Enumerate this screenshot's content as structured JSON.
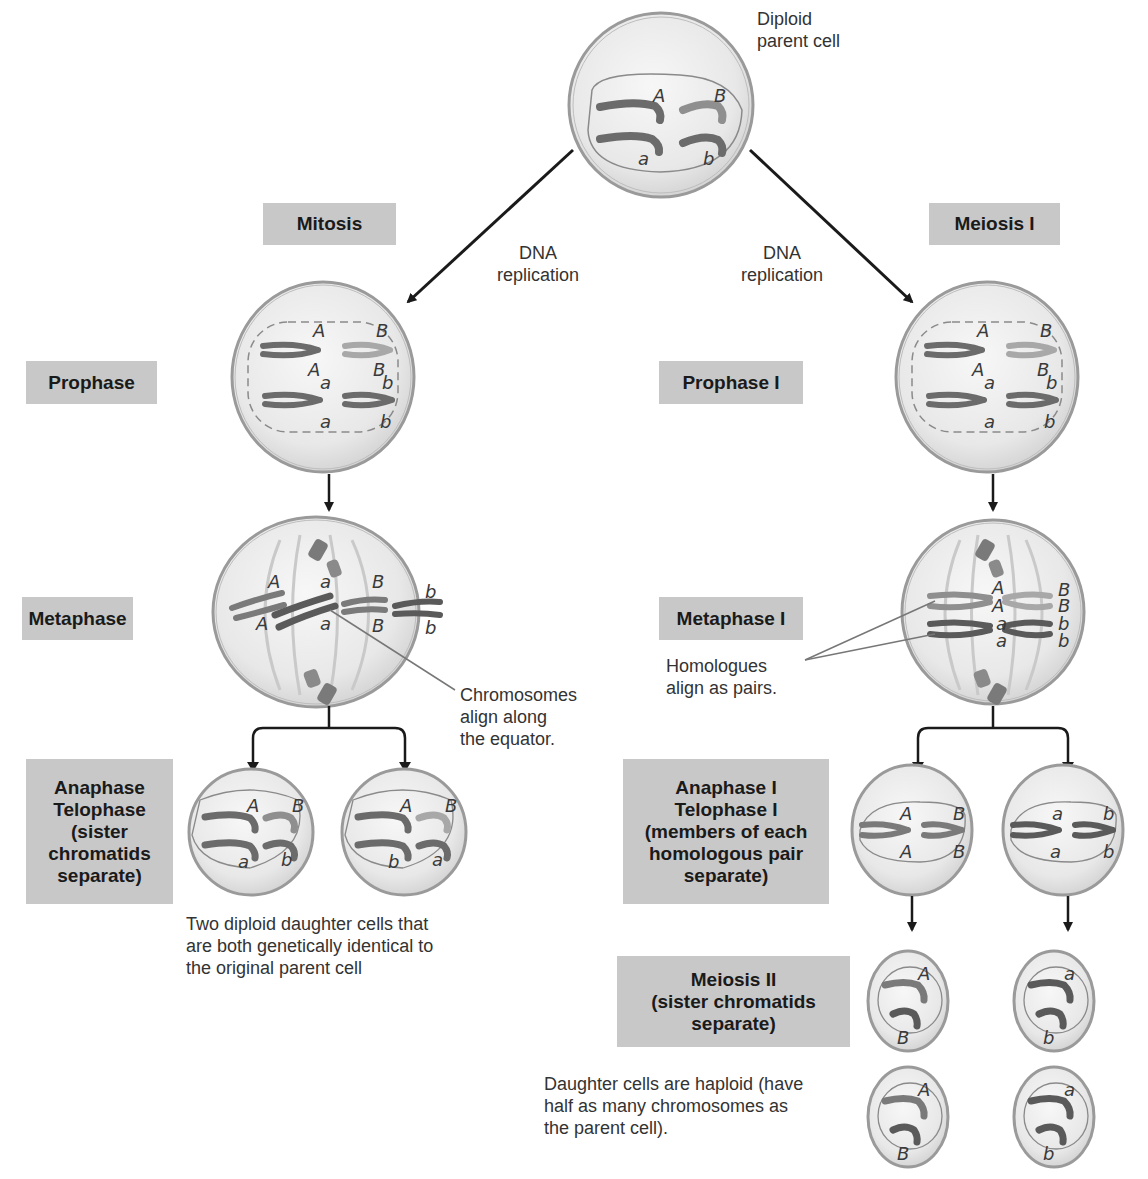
{
  "parent_cell": {
    "label_line1": "Diploid",
    "label_line2": "parent cell",
    "alleles": [
      "A",
      "B",
      "a",
      "b"
    ]
  },
  "branches": {
    "mitosis": {
      "header": "Mitosis",
      "replication_line1": "DNA",
      "replication_line2": "replication",
      "stages": {
        "prophase": {
          "label": "Prophase",
          "alleles_top": [
            "A",
            "B"
          ],
          "alleles_mid": [
            "A",
            "a",
            "B",
            "b"
          ],
          "alleles_bottom": [
            "a",
            "b"
          ]
        },
        "metaphase": {
          "label": "Metaphase",
          "alleles_top": [
            "A",
            "a",
            "B",
            "b"
          ],
          "alleles_bottom": [
            "A",
            "a",
            "B",
            "b"
          ]
        },
        "anaphase": {
          "label_line1": "Anaphase",
          "label_line2": "Telophase",
          "label_line3": "(sister",
          "label_line4": "chromatids",
          "label_line5": "separate)",
          "cells": [
            {
              "alleles": [
                "A",
                "B",
                "a",
                "b"
              ]
            },
            {
              "alleles": [
                "A",
                "B",
                "b",
                "a"
              ]
            }
          ]
        }
      },
      "annotation_metaphase_line1": "Chromosomes",
      "annotation_metaphase_line2": "align along",
      "annotation_metaphase_line3": "the equator.",
      "result_line1": "Two diploid daughter cells that",
      "result_line2": "are both genetically identical to",
      "result_line3": "the original parent cell"
    },
    "meiosis": {
      "header": "Meiosis I",
      "replication_line1": "DNA",
      "replication_line2": "replication",
      "stages": {
        "prophase": {
          "label": "Prophase I"
        },
        "metaphase": {
          "label": "Metaphase I"
        },
        "anaphase": {
          "label_line1": "Anaphase I",
          "label_line2": "Telophase I",
          "label_line3": "(members of each",
          "label_line4": "homologous pair",
          "label_line5": "separate)",
          "cells": [
            {
              "alleles": [
                "A",
                "B",
                "A",
                "B"
              ]
            },
            {
              "alleles": [
                "a",
                "b",
                "a",
                "b"
              ]
            }
          ]
        },
        "meiosis2": {
          "label_line1": "Meiosis II",
          "label_line2": "(sister chromatids",
          "label_line3": "separate)",
          "cells": [
            {
              "alleles": [
                "A",
                "B"
              ]
            },
            {
              "alleles": [
                "a",
                "b"
              ]
            },
            {
              "alleles": [
                "A",
                "B"
              ]
            },
            {
              "alleles": [
                "a",
                "b"
              ]
            }
          ]
        }
      },
      "annotation_metaphase_line1": "Homologues",
      "annotation_metaphase_line2": "align as pairs.",
      "result_line1": "Daughter cells are haploid (have",
      "result_line2": "half as many chromosomes as",
      "result_line3": "the parent cell)."
    }
  },
  "colors": {
    "label_box": "#c8c8c8",
    "cell_fill": "#ececec",
    "cell_border": "#9a9a9a",
    "chromosome_dark": "#6b6b6b",
    "chromosome_light": "#a8a8a8",
    "arrow": "#1a1a1a"
  }
}
